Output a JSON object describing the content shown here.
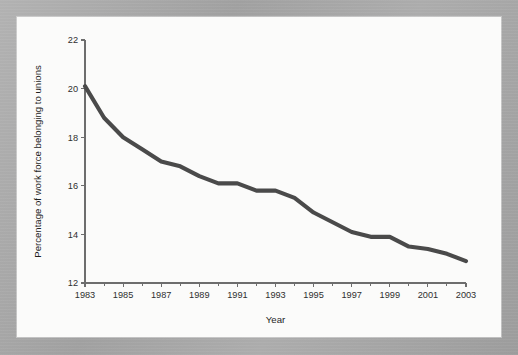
{
  "figure": {
    "background_color": "#a8a8a8",
    "card_color": "#fbfbfa"
  },
  "chart_data": {
    "type": "line",
    "title": "",
    "subtitle": "",
    "xlabel": "Year",
    "ylabel": "Percentage of work force belonging to unions",
    "xlim": [
      1983,
      2003
    ],
    "ylim": [
      12,
      22
    ],
    "grid": false,
    "legend": false,
    "legend_position": "none",
    "line_color": "#4a4a4a",
    "x_tick_labels": [
      "1983",
      "1985",
      "1987",
      "1989",
      "1991",
      "1993",
      "1995",
      "1997",
      "1999",
      "2001",
      "2003"
    ],
    "x_tick_values": [
      1983,
      1985,
      1987,
      1989,
      1991,
      1993,
      1995,
      1997,
      1999,
      2001,
      2003
    ],
    "x_minor_tick_values": [
      1984,
      1986,
      1988,
      1990,
      1992,
      1994,
      1996,
      1998,
      2000,
      2002
    ],
    "y_tick_labels": [
      "12",
      "14",
      "16",
      "18",
      "20",
      "22"
    ],
    "y_tick_values": [
      12,
      14,
      16,
      18,
      20,
      22
    ],
    "x": [
      1983,
      1984,
      1985,
      1986,
      1987,
      1988,
      1989,
      1990,
      1991,
      1992,
      1993,
      1994,
      1995,
      1996,
      1997,
      1998,
      1999,
      2000,
      2001,
      2002,
      2003
    ],
    "values": [
      20.1,
      18.8,
      18.0,
      17.5,
      17.0,
      16.8,
      16.4,
      16.1,
      16.1,
      15.8,
      15.8,
      15.5,
      14.9,
      14.5,
      14.1,
      13.9,
      13.9,
      13.5,
      13.4,
      13.2,
      12.9
    ],
    "series": [
      {
        "name": "Percentage of work force belonging to unions",
        "color": "#4a4a4a",
        "values": [
          20.1,
          18.8,
          18.0,
          17.5,
          17.0,
          16.8,
          16.4,
          16.1,
          16.1,
          15.8,
          15.8,
          15.5,
          14.9,
          14.5,
          14.1,
          13.9,
          13.9,
          13.5,
          13.4,
          13.2,
          12.9
        ]
      }
    ],
    "annotations": []
  }
}
